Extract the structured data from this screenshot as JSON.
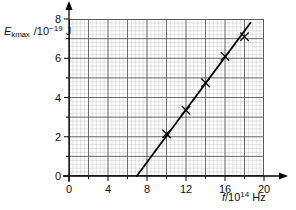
{
  "chart_data": {
    "type": "scatter",
    "title": "",
    "xlabel": "f/10^14 Hz",
    "ylabel": "E_kmax /10^-19 J",
    "xlabel_parts": {
      "symbol": "f",
      "divider": "/10",
      "exponent": "14",
      "unit": "Hz"
    },
    "ylabel_parts": {
      "symbol": "E",
      "subscript": "kmax",
      "divider": "/10",
      "exponent": "−19",
      "unit": "J"
    },
    "xlim": [
      0,
      20
    ],
    "ylim": [
      0,
      8
    ],
    "xticks": [
      0,
      4,
      8,
      12,
      16,
      20
    ],
    "yticks": [
      0,
      2,
      4,
      6,
      8
    ],
    "xtick_labels": [
      "0",
      "4",
      "8",
      "12",
      "16",
      "20"
    ],
    "ytick_labels": [
      "0",
      "2",
      "4",
      "6",
      "8"
    ],
    "x_minor_step": 0.4,
    "y_minor_step": 0.2,
    "x_major_step": 2,
    "y_major_step": 1,
    "grid": true,
    "grid_minor_color": "#b9b9b9",
    "grid_major_color": "#4f4f4f",
    "legend": "none",
    "marker": "x-cross",
    "series": [
      {
        "name": "Photoelectron maximum kinetic energy",
        "x": [
          10.0,
          12.0,
          14.0,
          16.0,
          18.0
        ],
        "values": [
          2.15,
          3.35,
          4.75,
          6.1,
          7.1
        ]
      }
    ],
    "fit_line": {
      "name": "line of best fit",
      "x_start": 6.95,
      "y_start": 0.0,
      "x_end": 18.6,
      "y_end": 7.8,
      "x_intercept": 6.95,
      "color": "#000000"
    },
    "axis_color": "#000000",
    "marker_color": "#000000"
  }
}
